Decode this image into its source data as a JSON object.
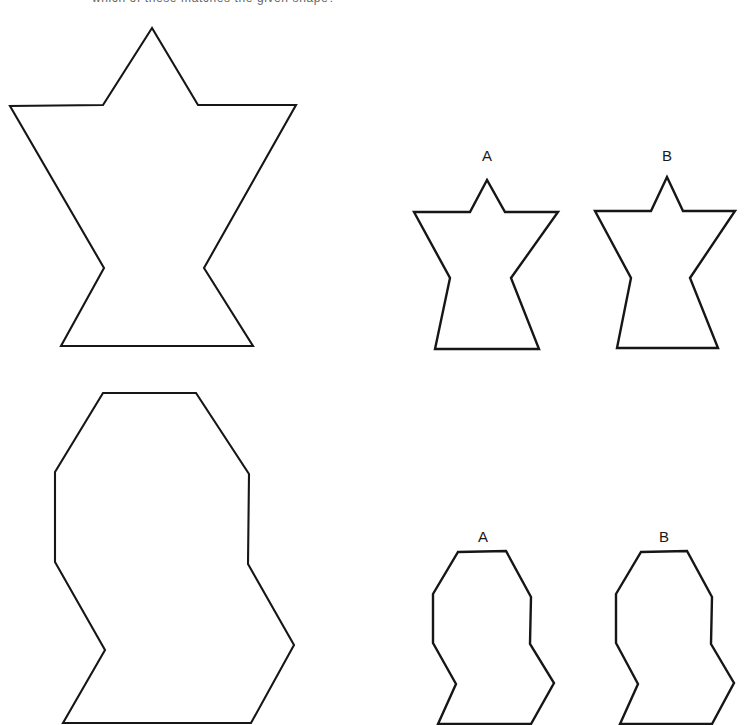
{
  "figure": {
    "title_fragment": "which of these matches the given shape?",
    "stroke_color": "#161616",
    "fill_color": "#ffffff",
    "background_color": "#ffffff",
    "width": 753,
    "height": 725,
    "task_type": "shape-matching"
  },
  "rows": [
    {
      "id": "row-top",
      "reference": {
        "name": "reference-star-shape",
        "description": "large star-like polygon with pointed top and notched waist",
        "bbox": [
          10,
          28,
          296,
          347
        ],
        "points": "152,28 103,105 10,106 104,268 61,346 253,346 204,268 296,105 198,105"
      },
      "options": [
        {
          "label": "A",
          "name": "option-a-star",
          "label_pos": [
            487,
            161
          ],
          "points": "487,180 470,212 414,212 450,278 435,349 539,349 511,278 558,212 505,212"
        },
        {
          "label": "B",
          "name": "option-b-star",
          "label_pos": [
            667,
            161
          ],
          "points": "667,177 651,211 595,211 631,278 617,348 718,348 690,278 735,211 683,211"
        }
      ]
    },
    {
      "id": "row-bottom",
      "reference": {
        "name": "reference-blob-shape",
        "description": "large rounded octagonal polygon with stepped right side and notched lower left",
        "bbox": [
          55,
          393,
          294,
          723
        ],
        "points": "103,393 196,393 249,474 248,564 294,645 251,723 63,723 105,650 55,562 55,472"
      },
      "options": [
        {
          "label": "A",
          "name": "option-a-blob",
          "label_pos": [
            483,
            542
          ],
          "points": "458,552 506,551 531,597 530,644 554,683 531,724 438,724 456,684 433,643 433,594"
        },
        {
          "label": "B",
          "name": "option-b-blob",
          "label_pos": [
            664,
            542
          ],
          "points": "641,552 687,551 712,597 711,644 734,683 712,724 620,724 638,684 616,643 616,594"
        }
      ]
    }
  ],
  "labels": {
    "option_a": "A",
    "option_b": "B"
  }
}
